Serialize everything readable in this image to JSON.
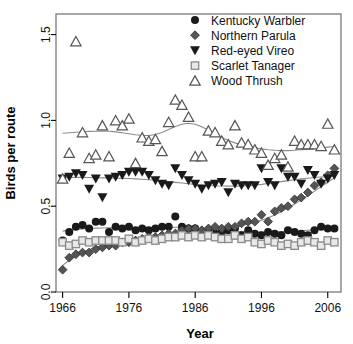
{
  "chart_data": {
    "type": "scatter",
    "title": "",
    "xlabel": "Year",
    "ylabel": "Birds per route",
    "xlim": [
      1965,
      2008
    ],
    "ylim": [
      0.0,
      1.62
    ],
    "xticks": [
      1966,
      1976,
      1986,
      1996,
      2006
    ],
    "yticks": [
      0.0,
      0.5,
      1.0,
      1.5
    ],
    "xtick_labels": [
      "1966",
      "1976",
      "1986",
      "1996",
      "2006"
    ],
    "ytick_labels": [
      "0.0",
      "0.5",
      "1.0",
      "1.5"
    ],
    "grid": false,
    "legend_position": "top-right",
    "x": [
      1966,
      1967,
      1968,
      1969,
      1970,
      1971,
      1972,
      1973,
      1974,
      1975,
      1976,
      1977,
      1978,
      1979,
      1980,
      1981,
      1982,
      1983,
      1984,
      1985,
      1986,
      1987,
      1988,
      1989,
      1990,
      1991,
      1992,
      1993,
      1994,
      1995,
      1996,
      1997,
      1998,
      1999,
      2000,
      2001,
      2002,
      2003,
      2004,
      2005,
      2006,
      2007
    ],
    "series": [
      {
        "name": "Kentucky Warbler",
        "marker": "filled-circle",
        "color": "#1a1a1a",
        "has_trend_line": true,
        "values": [
          0.3,
          0.35,
          0.38,
          0.39,
          0.37,
          0.41,
          0.41,
          0.35,
          0.38,
          0.37,
          0.38,
          0.36,
          0.37,
          0.36,
          0.37,
          0.38,
          0.38,
          0.44,
          0.38,
          0.37,
          0.37,
          0.35,
          0.36,
          0.34,
          0.35,
          0.36,
          0.37,
          0.33,
          0.36,
          0.34,
          0.33,
          0.35,
          0.34,
          0.33,
          0.36,
          0.35,
          0.34,
          0.33,
          0.36,
          0.38,
          0.37,
          0.37
        ],
        "trend": [
          0.355,
          0.36,
          0.365,
          0.368,
          0.37,
          0.372,
          0.373,
          0.374,
          0.375,
          0.375,
          0.375,
          0.374,
          0.374,
          0.374,
          0.374,
          0.375,
          0.376,
          0.377,
          0.377,
          0.375,
          0.372,
          0.368,
          0.364,
          0.36,
          0.357,
          0.355,
          0.353,
          0.352,
          0.351,
          0.35,
          0.35,
          0.35,
          0.351,
          0.352,
          0.353,
          0.355,
          0.357,
          0.36,
          0.363,
          0.366,
          0.368,
          0.37
        ]
      },
      {
        "name": "Northern Parula",
        "marker": "filled-diamond",
        "color": "#555555",
        "has_trend_line": true,
        "values": [
          0.13,
          0.2,
          0.22,
          0.23,
          0.23,
          0.25,
          0.26,
          0.27,
          0.27,
          0.29,
          0.29,
          0.3,
          0.31,
          0.32,
          0.32,
          0.33,
          0.34,
          0.34,
          0.36,
          0.37,
          0.37,
          0.36,
          0.37,
          0.38,
          0.37,
          0.38,
          0.38,
          0.4,
          0.41,
          0.41,
          0.45,
          0.41,
          0.47,
          0.49,
          0.5,
          0.54,
          0.55,
          0.58,
          0.62,
          0.64,
          0.68,
          0.72
        ],
        "trend": [
          0.155,
          0.185,
          0.21,
          0.23,
          0.246,
          0.259,
          0.27,
          0.279,
          0.287,
          0.294,
          0.3,
          0.306,
          0.312,
          0.318,
          0.323,
          0.329,
          0.334,
          0.34,
          0.345,
          0.35,
          0.355,
          0.359,
          0.363,
          0.367,
          0.371,
          0.376,
          0.381,
          0.388,
          0.396,
          0.406,
          0.418,
          0.432,
          0.449,
          0.468,
          0.49,
          0.513,
          0.537,
          0.562,
          0.588,
          0.614,
          0.64,
          0.666
        ]
      },
      {
        "name": "Red-eyed Vireo",
        "marker": "filled-triangle-down",
        "color": "#1a1a1a",
        "has_trend_line": true,
        "values": [
          0.66,
          0.67,
          0.69,
          0.68,
          0.6,
          0.66,
          0.55,
          0.66,
          0.67,
          0.68,
          0.7,
          0.7,
          0.7,
          0.68,
          0.65,
          0.63,
          0.62,
          0.72,
          0.68,
          0.65,
          0.63,
          0.6,
          0.62,
          0.63,
          0.64,
          0.58,
          0.63,
          0.62,
          0.62,
          0.62,
          0.72,
          0.64,
          0.62,
          0.72,
          0.67,
          0.67,
          0.63,
          0.71,
          0.68,
          0.63,
          0.66,
          0.68
        ],
        "trend": [
          0.665,
          0.667,
          0.668,
          0.668,
          0.667,
          0.666,
          0.665,
          0.664,
          0.663,
          0.662,
          0.661,
          0.659,
          0.657,
          0.654,
          0.651,
          0.647,
          0.643,
          0.639,
          0.635,
          0.631,
          0.627,
          0.624,
          0.621,
          0.619,
          0.618,
          0.617,
          0.617,
          0.618,
          0.62,
          0.623,
          0.627,
          0.632,
          0.637,
          0.643,
          0.649,
          0.654,
          0.659,
          0.663,
          0.667,
          0.67,
          0.672,
          0.674
        ]
      },
      {
        "name": "Scarlet Tanager",
        "marker": "open-square",
        "color": "#8a8a8a",
        "has_trend_line": true,
        "values": [
          0.29,
          0.27,
          0.28,
          0.3,
          0.29,
          0.3,
          0.3,
          0.3,
          0.3,
          0.29,
          0.31,
          0.29,
          0.3,
          0.31,
          0.3,
          0.31,
          0.32,
          0.32,
          0.33,
          0.32,
          0.33,
          0.32,
          0.33,
          0.32,
          0.31,
          0.31,
          0.33,
          0.31,
          0.32,
          0.29,
          0.28,
          0.3,
          0.29,
          0.27,
          0.28,
          0.27,
          0.29,
          0.3,
          0.29,
          0.27,
          0.3,
          0.29
        ],
        "trend": [
          0.288,
          0.29,
          0.292,
          0.294,
          0.296,
          0.298,
          0.299,
          0.301,
          0.302,
          0.304,
          0.305,
          0.306,
          0.308,
          0.309,
          0.311,
          0.312,
          0.314,
          0.315,
          0.316,
          0.317,
          0.317,
          0.317,
          0.316,
          0.315,
          0.313,
          0.311,
          0.309,
          0.306,
          0.303,
          0.3,
          0.297,
          0.294,
          0.292,
          0.29,
          0.288,
          0.287,
          0.287,
          0.287,
          0.288,
          0.289,
          0.29,
          0.292
        ]
      },
      {
        "name": "Wood Thrush",
        "marker": "open-triangle-up",
        "color": "#555555",
        "has_trend_line": true,
        "values": [
          0.66,
          0.81,
          1.46,
          0.93,
          0.78,
          0.8,
          0.97,
          0.79,
          1.0,
          0.97,
          1.01,
          0.75,
          0.9,
          0.88,
          0.89,
          0.82,
          0.99,
          1.12,
          1.09,
          1.02,
          0.79,
          0.79,
          0.94,
          0.93,
          0.88,
          0.86,
          0.97,
          0.87,
          0.86,
          0.83,
          0.81,
          0.74,
          0.78,
          0.8,
          0.73,
          0.88,
          0.86,
          0.86,
          0.86,
          0.85,
          0.98,
          0.83
        ],
        "trend": [
          0.925,
          0.928,
          0.931,
          0.934,
          0.936,
          0.937,
          0.938,
          0.937,
          0.933,
          0.928,
          0.922,
          0.916,
          0.912,
          0.912,
          0.918,
          0.93,
          0.947,
          0.965,
          0.978,
          0.983,
          0.978,
          0.963,
          0.943,
          0.921,
          0.9,
          0.883,
          0.869,
          0.858,
          0.849,
          0.841,
          0.834,
          0.829,
          0.826,
          0.824,
          0.824,
          0.826,
          0.829,
          0.832,
          0.836,
          0.84,
          0.844,
          0.848
        ]
      }
    ]
  },
  "legend": {
    "entries": [
      {
        "label": "Kentucky Warbler",
        "marker": "filled-circle"
      },
      {
        "label": "Northern Parula",
        "marker": "filled-diamond"
      },
      {
        "label": "Red-eyed Vireo",
        "marker": "filled-triangle-down"
      },
      {
        "label": "Scarlet Tanager",
        "marker": "open-square"
      },
      {
        "label": "Wood Thrush",
        "marker": "open-triangle-up"
      }
    ]
  },
  "colors": {
    "axis": "#000000",
    "frame": "#6e6e6e",
    "trend_line": "#8a8a8a",
    "text": "#111111"
  }
}
